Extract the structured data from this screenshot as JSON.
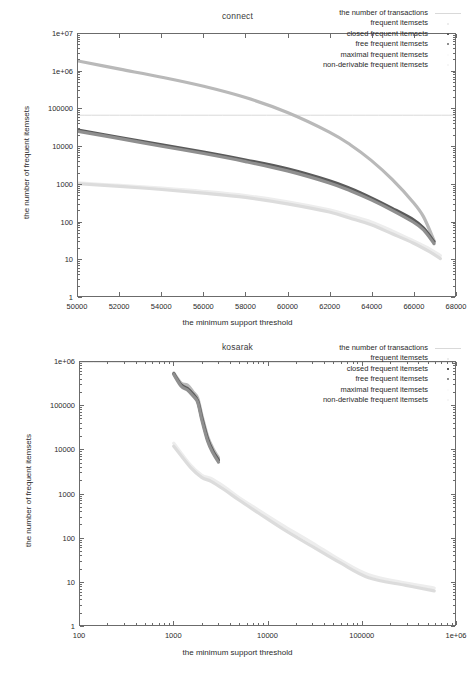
{
  "figure": {
    "axis_titles": {
      "x": "the minimum support threshold",
      "y": "the number of frequent itemsets"
    },
    "series_names": [
      "the number of transactions",
      "frequent itemsets",
      "closed frequent itemsets",
      "free frequent itemsets",
      "maximal frequent itemsets",
      "non-derivable frequent itemsets"
    ],
    "series_colors": [
      "#d9d9d9",
      "#b9b9b9",
      "#5a5a5a",
      "#8f8f8f",
      "#ededed",
      "#dcdcdc"
    ],
    "frame_color": "#6b6b6b"
  },
  "chart_data": [
    {
      "type": "line",
      "title": "connect",
      "xlabel": "the minimum support threshold",
      "ylabel": "the number of frequent itemsets",
      "xscale": "linear",
      "yscale": "log",
      "xlim": [
        50000,
        68000
      ],
      "ylim": [
        1,
        10000000
      ],
      "xticks": [
        50000,
        52000,
        54000,
        56000,
        58000,
        60000,
        62000,
        64000,
        66000,
        68000
      ],
      "xtick_labels": [
        "50000",
        "52000",
        "54000",
        "56000",
        "58000",
        "60000",
        "62000",
        "64000",
        "66000",
        "68000"
      ],
      "yticks": [
        1,
        10,
        100,
        1000,
        10000,
        100000,
        1000000,
        10000000
      ],
      "ytick_labels": [
        "1",
        "10",
        "100",
        "1000",
        "10000",
        "100000",
        "1e+06",
        "1e+07"
      ],
      "grid": false,
      "legend_position": "top-right",
      "series": [
        {
          "name": "the number of transactions",
          "style": "line",
          "color": "#d9d9d9",
          "x": [
            50000,
            68000
          ],
          "values": [
            67557,
            67557
          ]
        },
        {
          "name": "frequent itemsets",
          "style": "points",
          "color": "#b9b9b9",
          "x": [
            50000,
            52000,
            54000,
            56000,
            58000,
            60000,
            62000,
            63000,
            64000,
            65000,
            66000,
            66500,
            67000
          ],
          "values": [
            1900000,
            1150000,
            700000,
            400000,
            200000,
            80000,
            24000,
            11000,
            4200,
            1300,
            320,
            130,
            30
          ]
        },
        {
          "name": "closed frequent itemsets",
          "style": "points",
          "color": "#5a5a5a",
          "x": [
            50000,
            52000,
            54000,
            56000,
            58000,
            60000,
            62000,
            63000,
            64000,
            65000,
            66000,
            66500,
            67000
          ],
          "values": [
            27000,
            17000,
            11000,
            7000,
            4300,
            2500,
            1200,
            750,
            420,
            220,
            110,
            65,
            28
          ]
        },
        {
          "name": "free frequent itemsets",
          "style": "points",
          "color": "#8f8f8f",
          "x": [
            50000,
            52000,
            54000,
            56000,
            58000,
            60000,
            62000,
            63000,
            64000,
            65000,
            66000,
            66500,
            67000
          ],
          "values": [
            25000,
            16000,
            10000,
            6400,
            3900,
            2200,
            1050,
            650,
            370,
            195,
            95,
            58,
            25
          ]
        },
        {
          "name": "maximal frequent itemsets",
          "style": "points",
          "color": "#ededed",
          "x": [
            50000,
            52000,
            54000,
            56000,
            58000,
            60000,
            62000,
            63000,
            64000,
            65000,
            66000,
            66800,
            67300
          ],
          "values": [
            1050,
            900,
            760,
            620,
            480,
            330,
            200,
            140,
            95,
            55,
            30,
            18,
            12
          ]
        },
        {
          "name": "non-derivable frequent itemsets",
          "style": "points",
          "color": "#dcdcdc",
          "x": [
            50000,
            52000,
            54000,
            56000,
            58000,
            60000,
            62000,
            63000,
            64000,
            65000,
            66000,
            66800,
            67300
          ],
          "values": [
            1000,
            850,
            700,
            560,
            430,
            290,
            175,
            120,
            80,
            46,
            26,
            15,
            10
          ]
        }
      ]
    },
    {
      "type": "line",
      "title": "kosarak",
      "xlabel": "the minimum support threshold",
      "ylabel": "the number of frequent itemsets",
      "xscale": "log",
      "yscale": "log",
      "xlim": [
        100,
        1000000
      ],
      "ylim": [
        1,
        1000000
      ],
      "xticks": [
        100,
        1000,
        10000,
        100000,
        1000000
      ],
      "xtick_labels": [
        "100",
        "1000",
        "10000",
        "100000",
        "1e+06"
      ],
      "yticks": [
        1,
        10,
        100,
        1000,
        10000,
        100000,
        1000000
      ],
      "ytick_labels": [
        "1",
        "10",
        "100",
        "1000",
        "10000",
        "100000",
        "1e+06"
      ],
      "grid": false,
      "legend_position": "top-right",
      "series": [
        {
          "name": "the number of transactions",
          "style": "line",
          "color": "#d9d9d9",
          "x": [
            100,
            1000000
          ],
          "values": [
            990002,
            990002
          ]
        },
        {
          "name": "frequent itemsets",
          "style": "points",
          "color": "#b9b9b9",
          "x": [
            1000,
            1200,
            1400,
            1600,
            1800,
            2000,
            2300,
            2600,
            3000
          ],
          "values": [
            560000,
            330000,
            300000,
            210000,
            150000,
            60000,
            20000,
            11000,
            6500
          ]
        },
        {
          "name": "closed frequent itemsets",
          "style": "points",
          "color": "#5a5a5a",
          "x": [
            1000,
            1200,
            1400,
            1600,
            1800,
            2000,
            2300,
            2600,
            3000
          ],
          "values": [
            540000,
            300000,
            250000,
            185000,
            130000,
            52000,
            17500,
            9500,
            5800
          ]
        },
        {
          "name": "free frequent itemsets",
          "style": "points",
          "color": "#8f8f8f",
          "x": [
            1000,
            1200,
            1400,
            1600,
            1800,
            2000,
            2300,
            2600,
            3000
          ],
          "values": [
            520000,
            280000,
            230000,
            170000,
            120000,
            46000,
            15500,
            8600,
            5200
          ]
        },
        {
          "name": "maximal frequent itemsets",
          "style": "points",
          "color": "#ededed",
          "x": [
            1000,
            1500,
            2000,
            2500,
            3500,
            5000,
            8000,
            15000,
            30000,
            60000,
            120000,
            300000,
            600000
          ],
          "values": [
            14000,
            4500,
            2600,
            2200,
            1400,
            800,
            420,
            180,
            75,
            30,
            14,
            9,
            7
          ]
        },
        {
          "name": "non-derivable frequent itemsets",
          "style": "points",
          "color": "#dcdcdc",
          "x": [
            1000,
            1500,
            2000,
            2500,
            3500,
            5000,
            8000,
            15000,
            30000,
            60000,
            120000,
            300000,
            600000
          ],
          "values": [
            12000,
            4000,
            2300,
            1900,
            1200,
            700,
            360,
            150,
            62,
            26,
            12,
            8,
            6
          ]
        }
      ]
    }
  ]
}
